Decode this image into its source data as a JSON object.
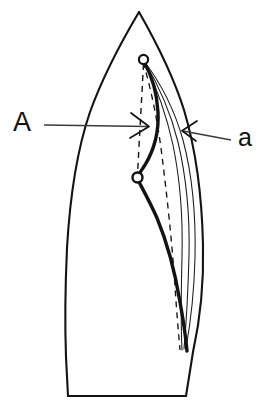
{
  "figure": {
    "type": "technical-line-drawing",
    "width": 269,
    "height": 416,
    "background_color": "#ffffff",
    "stroke_color": "#131313"
  },
  "labels": {
    "left": {
      "text": "A",
      "x": 22,
      "y": 131,
      "font_size": 27,
      "meaning": "deflection-amplitude-label"
    },
    "right": {
      "text": "a",
      "x": 240,
      "y": 146,
      "font_size": 25,
      "meaning": "angle-label"
    }
  },
  "annotations": {
    "left_arrow": {
      "name": "leader-line-A",
      "from_x": 44,
      "from_y": 124,
      "to_x": 149,
      "to_y": 126,
      "direction": "right"
    },
    "right_arrow": {
      "name": "leader-line-a",
      "from_x": 231,
      "from_y": 139,
      "to_x": 182,
      "to_y": 131,
      "direction": "left"
    }
  },
  "nodes": [
    {
      "name": "upper-node",
      "x": 143.5,
      "y": 59.5,
      "radius": 4.6
    },
    {
      "name": "lower-node",
      "x": 137.5,
      "y": 177.5,
      "radius": 5.0
    }
  ],
  "outline": {
    "name": "blade-outline",
    "apex_x": 139,
    "apex_y": 12,
    "base_left_x": 68,
    "base_left_y": 396,
    "base_right_x": 186,
    "base_right_y": 396,
    "stroke_width": 2.1
  },
  "curves": {
    "thick_deflection": {
      "name": "primary-deflection-curve",
      "stroke_width": 3.4,
      "description": "Bold curve from upper node bowing right then through lower node down to base"
    },
    "thin_family": {
      "name": "secondary-curve-family",
      "count": 3,
      "stroke_width": 1.1,
      "description": "Three fine curves fanning from upper node converging at base"
    },
    "dashed_vertical": {
      "name": "axis-dashed-line",
      "stroke_width": 1.3,
      "dash_pattern": "6 5",
      "description": "Vertical dashed line joining upper and lower nodes"
    },
    "dashed_curve": {
      "name": "reference-dashed-curve",
      "stroke_width": 1.3,
      "dash_pattern": "6 5",
      "description": "Dashed curve from lower node region toward base inside the fan"
    }
  }
}
